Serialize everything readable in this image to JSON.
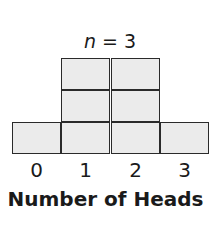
{
  "chart_data": {
    "type": "bar",
    "style": "stacked-unit-boxes",
    "title_var": "n",
    "title_rest": " = 3",
    "title": "n = 3",
    "categories": [
      "0",
      "1",
      "2",
      "3"
    ],
    "values": [
      1,
      3,
      3,
      1
    ],
    "xlabel": "Number of Heads",
    "ylabel": "",
    "grid": false,
    "legend": null,
    "colors": {
      "fill": "#ebebeb",
      "stroke": "#2a2a2a"
    }
  }
}
